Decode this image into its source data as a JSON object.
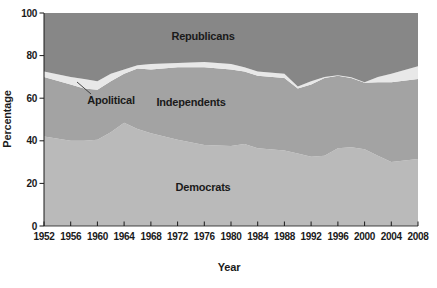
{
  "chart_data": {
    "type": "area",
    "stacked": true,
    "title": "",
    "xlabel": "Year",
    "ylabel": "Percentage",
    "x_range": [
      1952,
      2008
    ],
    "ylim": [
      0,
      100
    ],
    "x_ticks": [
      1952,
      1956,
      1960,
      1964,
      1968,
      1972,
      1976,
      1980,
      1984,
      1988,
      1992,
      1996,
      2000,
      2004,
      2008
    ],
    "y_ticks": [
      0,
      20,
      40,
      60,
      80,
      100
    ],
    "grid": false,
    "legend": "labels-inside-areas",
    "years": [
      1952,
      1956,
      1958,
      1960,
      1962,
      1964,
      1966,
      1968,
      1972,
      1976,
      1980,
      1982,
      1984,
      1988,
      1990,
      1992,
      1994,
      1996,
      1998,
      2000,
      2002,
      2004,
      2008
    ],
    "series": [
      {
        "name": "Democrats",
        "color": "#bababa",
        "values": [
          42,
          40,
          40,
          40.5,
          44,
          48.5,
          45.5,
          43.5,
          40.5,
          38,
          37.5,
          38.5,
          36.5,
          35.5,
          34,
          32.5,
          33,
          36.5,
          37,
          36,
          33,
          30,
          31.5
        ]
      },
      {
        "name": "Independents",
        "color": "#a3a3a3",
        "values": [
          28,
          26.5,
          24.5,
          23.5,
          24,
          23,
          28.5,
          30,
          34,
          36.5,
          36,
          34,
          34,
          34,
          30.5,
          34,
          36.5,
          34,
          32.5,
          31.3,
          34.5,
          37.5,
          37.5
        ]
      },
      {
        "name": "Apolitical",
        "color": "#e8e8e8",
        "values": [
          2.5,
          3.5,
          4.5,
          4,
          3.5,
          2,
          1.5,
          2.5,
          2,
          2.5,
          2.5,
          2,
          2,
          2,
          1,
          1.5,
          0.5,
          0.3,
          0.3,
          0.2,
          2.5,
          4,
          6
        ]
      },
      {
        "name": "Republicans",
        "color": "#878787",
        "values": [
          27.5,
          30,
          31,
          32,
          28.5,
          26.5,
          24.5,
          24,
          23.5,
          23,
          24,
          25.5,
          27.5,
          28.5,
          34.5,
          32,
          30,
          29.2,
          30.2,
          32.5,
          30,
          28.5,
          25
        ]
      }
    ],
    "area_labels": {
      "republicans": "Republicans",
      "independents": "Independents",
      "democrats": "Democrats",
      "apolitical": "Apolitical"
    },
    "axis_color": "#1a1a1a"
  }
}
